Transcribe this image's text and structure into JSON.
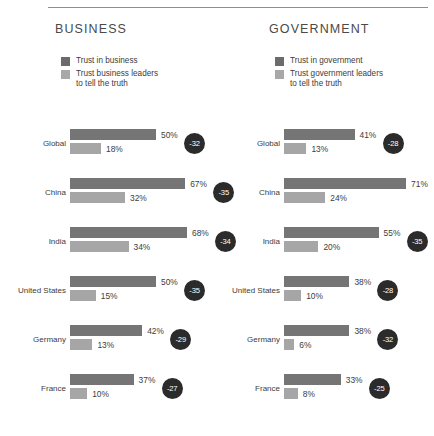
{
  "chart_data": {
    "type": "bar",
    "title": "",
    "xlabel": "",
    "ylabel": "",
    "xlim": [
      0,
      100
    ],
    "grid": false,
    "legend_position": "top-left",
    "categories": [
      "Global",
      "China",
      "India",
      "United States",
      "Germany",
      "France"
    ],
    "panels": [
      {
        "title": "BUSINESS",
        "legend": [
          {
            "label": "Trust in business",
            "swatch": "dark"
          },
          {
            "label": "Trust business leaders\nto tell the truth",
            "swatch": "light"
          }
        ],
        "series": [
          {
            "name": "Trust in business",
            "values": [
              50,
              67,
              68,
              50,
              42,
              37
            ]
          },
          {
            "name": "Trust business leaders to tell the truth",
            "values": [
              18,
              32,
              34,
              15,
              13,
              10
            ]
          }
        ],
        "rows": [
          {
            "label": "Global",
            "top": 50,
            "top_text": "50%",
            "bottom": 18,
            "bottom_text": "18%",
            "gap": "-32"
          },
          {
            "label": "China",
            "top": 67,
            "top_text": "67%",
            "bottom": 32,
            "bottom_text": "32%",
            "gap": "-35"
          },
          {
            "label": "India",
            "top": 68,
            "top_text": "68%",
            "bottom": 34,
            "bottom_text": "34%",
            "gap": "-34"
          },
          {
            "label": "United States",
            "top": 50,
            "top_text": "50%",
            "bottom": 15,
            "bottom_text": "15%",
            "gap": "-35"
          },
          {
            "label": "Germany",
            "top": 42,
            "top_text": "42%",
            "bottom": 13,
            "bottom_text": "13%",
            "gap": "-29"
          },
          {
            "label": "France",
            "top": 37,
            "top_text": "37%",
            "bottom": 10,
            "bottom_text": "10%",
            "gap": "-27"
          }
        ]
      },
      {
        "title": "GOVERNMENT",
        "legend": [
          {
            "label": "Trust in government",
            "swatch": "dark"
          },
          {
            "label": "Trust government leaders\nto tell the truth",
            "swatch": "light"
          }
        ],
        "series": [
          {
            "name": "Trust in government",
            "values": [
              41,
              71,
              55,
              38,
              38,
              33
            ]
          },
          {
            "name": "Trust government leaders to tell the truth",
            "values": [
              13,
              24,
              20,
              10,
              6,
              8
            ]
          }
        ],
        "rows": [
          {
            "label": "Global",
            "top": 41,
            "top_text": "41%",
            "bottom": 13,
            "bottom_text": "13%",
            "gap": "-28"
          },
          {
            "label": "China",
            "top": 71,
            "top_text": "71%",
            "bottom": 24,
            "bottom_text": "24%",
            "gap": "-47"
          },
          {
            "label": "India",
            "top": 55,
            "top_text": "55%",
            "bottom": 20,
            "bottom_text": "20%",
            "gap": "-35"
          },
          {
            "label": "United States",
            "top": 38,
            "top_text": "38%",
            "bottom": 10,
            "bottom_text": "10%",
            "gap": "-28"
          },
          {
            "label": "Germany",
            "top": 38,
            "top_text": "38%",
            "bottom": 6,
            "bottom_text": "6%",
            "gap": "-32"
          },
          {
            "label": "France",
            "top": 33,
            "top_text": "33%",
            "bottom": 8,
            "bottom_text": "8%",
            "gap": "-25"
          }
        ]
      }
    ],
    "colors": {
      "bar_dark": "#757575",
      "bar_light": "#a6a6a6",
      "badge": "#2b2b2b",
      "text": "#3d3d3d",
      "rule": "#8e8e8e"
    },
    "scale_px_per_percent": 1.72
  }
}
